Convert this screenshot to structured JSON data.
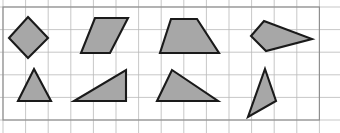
{
  "canvas": {
    "width": 340,
    "height": 133,
    "background": "#ffffff",
    "title": "Polygon shapes on grid paper"
  },
  "grid": {
    "name": "graph-paper-grid",
    "origin_x": 3,
    "origin_y": 7,
    "cell_size": 22.6,
    "cols": 14,
    "rows": 5,
    "line_color": "#b9b9b9",
    "line_width": 0.8,
    "border_color": "#8c8c8c",
    "border_width": 1.1,
    "show_grid": true
  },
  "style": {
    "shape_fill": "#a7a7a7",
    "shape_stroke": "#1a1a1a",
    "shape_stroke_width": 2.1
  },
  "shapes": [
    {
      "id": "shape-1",
      "name": "rhombus-diamond",
      "row": "top",
      "column": 1,
      "kind": "quadrilateral",
      "sides": 4,
      "points": "28,17 48,38 28,58 9,38"
    },
    {
      "id": "shape-2",
      "name": "parallelogram",
      "row": "top",
      "column": 2,
      "kind": "quadrilateral",
      "sides": 4,
      "points": "95,18 128,18 110,53 81,53"
    },
    {
      "id": "shape-3",
      "name": "trapezoid",
      "row": "top",
      "column": 3,
      "kind": "quadrilateral",
      "sides": 4,
      "points": "171,19 197,19 219,53 160,53"
    },
    {
      "id": "shape-4",
      "name": "kite-quadrilateral",
      "row": "top",
      "column": 4,
      "kind": "quadrilateral",
      "sides": 4,
      "points": "264,21 312,39 266,51 251,36"
    },
    {
      "id": "shape-5",
      "name": "isosceles-triangle",
      "row": "bottom",
      "column": 1,
      "kind": "triangle",
      "sides": 3,
      "points": "34,69 51,101 18,101"
    },
    {
      "id": "shape-6",
      "name": "right-triangle",
      "row": "bottom",
      "column": 2,
      "kind": "triangle",
      "sides": 3,
      "points": "126,70 126,101 74,101"
    },
    {
      "id": "shape-7",
      "name": "scalene-triangle",
      "row": "bottom",
      "column": 3,
      "kind": "triangle",
      "sides": 3,
      "points": "172,70 218,101 157,101"
    },
    {
      "id": "shape-8",
      "name": "narrow-scalene-triangle",
      "row": "bottom",
      "column": 4,
      "kind": "triangle",
      "sides": 3,
      "points": "265,69 276,101 248,117"
    }
  ]
}
